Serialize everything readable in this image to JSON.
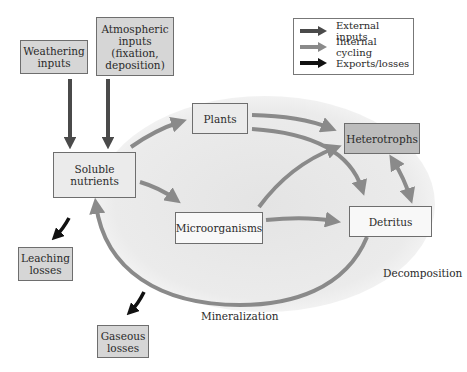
{
  "diagram": {
    "type": "nutrient-cycle-flow",
    "nodes": {
      "weathering_inputs": {
        "label_lines": [
          "Weathering",
          "inputs"
        ],
        "category": "external-input"
      },
      "atmospheric_inputs": {
        "label_lines": [
          "Atmospheric",
          "inputs",
          "(fixation,",
          "deposition)"
        ],
        "category": "external-input"
      },
      "soluble_nutrients": {
        "label_lines": [
          "Soluble",
          "nutrients"
        ],
        "category": "internal"
      },
      "plants": {
        "label": "Plants",
        "category": "internal"
      },
      "heterotrophs": {
        "label": "Heterotrophs",
        "category": "internal"
      },
      "microorganisms": {
        "label": "Microorganisms",
        "category": "internal"
      },
      "detritus": {
        "label": "Detritus",
        "category": "internal"
      },
      "leaching_losses": {
        "label_lines": [
          "Leaching",
          "losses"
        ],
        "category": "loss"
      },
      "gaseous_losses": {
        "label_lines": [
          "Gaseous",
          "losses"
        ],
        "category": "loss"
      }
    },
    "process_labels": {
      "decomposition": "Decomposition",
      "mineralization": "Mineralization"
    },
    "edges": [
      {
        "from": "weathering_inputs",
        "to": "soluble_nutrients",
        "kind": "external-input"
      },
      {
        "from": "atmospheric_inputs",
        "to": "soluble_nutrients",
        "kind": "external-input"
      },
      {
        "from": "soluble_nutrients",
        "to": "plants",
        "kind": "internal-cycling"
      },
      {
        "from": "soluble_nutrients",
        "to": "microorganisms",
        "kind": "internal-cycling"
      },
      {
        "from": "plants",
        "to": "heterotrophs",
        "kind": "internal-cycling"
      },
      {
        "from": "plants",
        "to": "detritus",
        "kind": "internal-cycling"
      },
      {
        "from": "microorganisms",
        "to": "heterotrophs",
        "kind": "internal-cycling"
      },
      {
        "from": "microorganisms",
        "to": "detritus",
        "kind": "internal-cycling"
      },
      {
        "from": "heterotrophs",
        "to": "detritus",
        "kind": "internal-cycling",
        "bidirectional": true
      },
      {
        "from": "detritus",
        "to": "soluble_nutrients",
        "kind": "internal-cycling",
        "via": "Decomposition / Mineralization"
      },
      {
        "from": "soluble_nutrients",
        "to": "leaching_losses",
        "kind": "export-loss"
      },
      {
        "from": "mineralization",
        "to": "gaseous_losses",
        "kind": "export-loss"
      }
    ]
  },
  "legend": {
    "items": [
      {
        "label": "External inputs",
        "color": "#4a4a4a"
      },
      {
        "label": "Internal cycling",
        "color": "#8a8a8a"
      },
      {
        "label": "Exports/losses",
        "color": "#111111"
      }
    ]
  },
  "colors": {
    "external_arrow": "#4a4a4a",
    "internal_arrow": "#8a8a8a",
    "loss_arrow": "#111111",
    "cycle_ellipse_fill": "#ececec",
    "cycle_ellipse_stroke": "#8a8a8a"
  }
}
